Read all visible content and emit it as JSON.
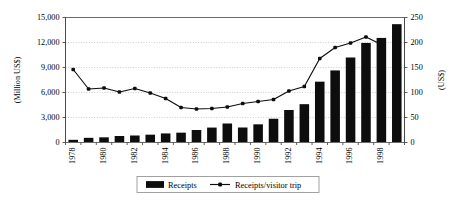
{
  "chart_data": {
    "type": "bar",
    "title": "",
    "subtitle": "",
    "xlabel": "",
    "ylabel": "(Million US$)",
    "y2label": "(US$)",
    "grid": true,
    "legend_position": "bottom",
    "categories": [
      "1978",
      "1979",
      "1980",
      "1981",
      "1982",
      "1983",
      "1984",
      "1985",
      "1986",
      "1987",
      "1988",
      "1989",
      "1990",
      "1991",
      "1992",
      "1993",
      "1994",
      "1995",
      "1996",
      "1997",
      "1998",
      "1999"
    ],
    "xtick_labels": [
      "1978",
      "",
      "1980",
      "",
      "1982",
      "",
      "1984",
      "",
      "1986",
      "",
      "1988",
      "",
      "1990",
      "",
      "1992",
      "",
      "1994",
      "",
      "1996",
      "",
      "1998",
      ""
    ],
    "ylim": [
      0,
      15000
    ],
    "yticks": [
      0,
      3000,
      6000,
      9000,
      12000,
      15000
    ],
    "ytick_labels": [
      "0",
      "3,000",
      "6,000",
      "9,000",
      "12,000",
      "15,000"
    ],
    "y2lim": [
      0,
      250
    ],
    "y2ticks": [
      0,
      50,
      100,
      150,
      200,
      250
    ],
    "y2tick_labels": [
      "0",
      "50",
      "100",
      "150",
      "200",
      "250"
    ],
    "series": [
      {
        "name": "Receipts",
        "type": "bar",
        "axis": "left",
        "unit": "Million US$",
        "color": "#0d0d0d",
        "values": [
          320,
          560,
          620,
          780,
          840,
          940,
          1090,
          1180,
          1500,
          1790,
          2280,
          1800,
          2180,
          2850,
          3900,
          4600,
          7300,
          8650,
          10200,
          11950,
          12550,
          14200
        ]
      },
      {
        "name": "Receipts/visitor trip",
        "type": "line",
        "axis": "right",
        "unit": "US$",
        "color": "#0d0d0d",
        "values": [
          146,
          107,
          109,
          101,
          108,
          99,
          88,
          70,
          67,
          68,
          71,
          78,
          82,
          86,
          103,
          112,
          168,
          190,
          199,
          211,
          196,
          null
        ]
      }
    ],
    "legend": [
      {
        "label": "Receipts",
        "marker": "bar"
      },
      {
        "label": "Receipts/visitor trip",
        "marker": "line-dot"
      }
    ]
  },
  "colors": {
    "series": "#0d0d0d",
    "grid": "#b8b8b8",
    "frame": "#6b6b6b",
    "background": "#ffffff"
  }
}
